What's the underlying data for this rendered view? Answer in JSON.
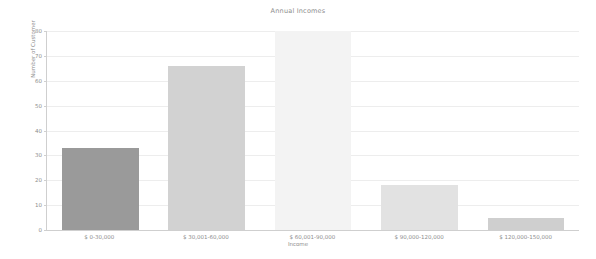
{
  "chart_data": {
    "type": "bar",
    "title": "Annual Incomes",
    "xlabel": "Income",
    "ylabel": "Number of Customer",
    "categories": [
      "$ 0-30,000",
      "$ 30,001-60,000",
      "$ 60,001-90,000",
      "$ 90,000-120,000",
      "$ 120,000-150,000"
    ],
    "values": [
      33,
      66,
      80,
      18,
      5
    ],
    "bar_colors": [
      "#9a9a9a",
      "#d2d2d2",
      "#f3f3f3",
      "#e2e2e2",
      "#cfcfcf"
    ],
    "ylim": [
      0,
      80
    ],
    "yticks": [
      0,
      10,
      20,
      30,
      40,
      50,
      60,
      70,
      80
    ],
    "ytick_labels": [
      "0",
      "10",
      "20",
      "30",
      "40",
      "50",
      "60",
      "70",
      "80"
    ],
    "grid": true,
    "legend": null,
    "background_color": "#ffffff",
    "axis_color": "#cfcfcf",
    "grid_color": "#ededed",
    "text_color": "#8d8d8d"
  }
}
